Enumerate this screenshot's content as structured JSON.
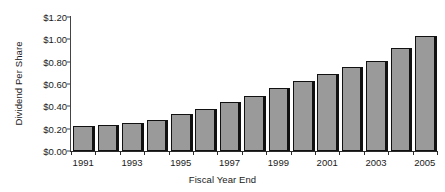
{
  "chart_data": {
    "type": "bar",
    "title": "",
    "xlabel": "Fiscal Year End",
    "ylabel": "Dividend Per Share",
    "categories": [
      "1991",
      "1992",
      "1993",
      "1994",
      "1995",
      "1996",
      "1997",
      "1998",
      "1999",
      "2000",
      "2001",
      "2002",
      "2003",
      "2004",
      "2005"
    ],
    "values": [
      0.22,
      0.23,
      0.25,
      0.28,
      0.33,
      0.38,
      0.44,
      0.49,
      0.56,
      0.63,
      0.69,
      0.75,
      0.81,
      0.92,
      1.03
    ],
    "visible_tick_labels": [
      "1991",
      "1993",
      "1995",
      "1997",
      "1999",
      "2001",
      "2003",
      "2005"
    ],
    "ylim": [
      0,
      1.2
    ],
    "yticks": [
      0.0,
      0.2,
      0.4,
      0.6,
      0.8,
      1.0,
      1.2
    ],
    "ytick_labels": [
      "$0.00",
      "$0.20",
      "$0.40",
      "$0.60",
      "$0.80",
      "$1.00",
      "$1.20"
    ],
    "grid": false,
    "legend": null,
    "series_color": "#9a9a9a",
    "outline_color": "#111111",
    "axis_color": "#2b2b2b"
  }
}
